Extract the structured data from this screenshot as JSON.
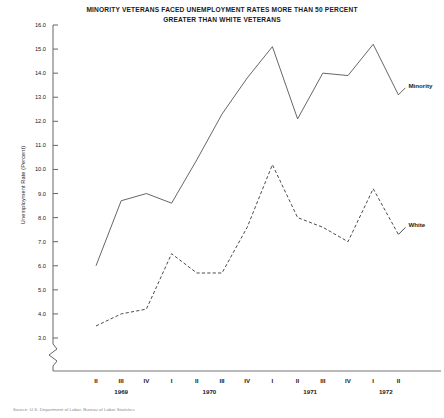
{
  "chart_data": {
    "type": "line",
    "title": "MINORITY VETERANS FACED UNEMPLOYMENT RATES MORE THAN 50 PERCENT GREATER THAN WHITE VETERANS",
    "title_line1": "MINORITY VETERANS FACED UNEMPLOYMENT RATES MORE THAN 50 PERCENT",
    "title_line2": "GREATER THAN WHITE VETERANS",
    "xlabel": "",
    "ylabel": "Unemployment Rate (Percent)",
    "ylim": [
      3.0,
      16.0
    ],
    "grid": false,
    "legend_position": "right-inline",
    "axis_break": true,
    "categories": [
      "II",
      "III",
      "IV",
      "I",
      "II",
      "III",
      "IV",
      "I",
      "II",
      "III",
      "IV",
      "I",
      "II"
    ],
    "years": [
      {
        "label": "1969",
        "start_index": 0,
        "end_index": 2
      },
      {
        "label": "1970",
        "start_index": 3,
        "end_index": 6
      },
      {
        "label": "1971",
        "start_index": 7,
        "end_index": 10
      },
      {
        "label": "1972",
        "start_index": 11,
        "end_index": 12
      }
    ],
    "ytick_labels": [
      "16.0",
      "15.0",
      "14.0",
      "13.0",
      "12.0",
      "11.0",
      "10.0",
      "9.0",
      "8.0",
      "7.0",
      "6.0",
      "5.0",
      "4.0",
      "3.0"
    ],
    "ytick_values": [
      16.0,
      15.0,
      14.0,
      13.0,
      12.0,
      11.0,
      10.0,
      9.0,
      8.0,
      7.0,
      6.0,
      5.0,
      4.0,
      3.0
    ],
    "series": [
      {
        "name": "Minority",
        "style": "solid",
        "color": "#4a4a4a",
        "values": [
          6.0,
          8.7,
          9.0,
          8.6,
          10.4,
          12.3,
          13.8,
          15.1,
          12.1,
          14.0,
          13.9,
          15.2,
          13.1
        ]
      },
      {
        "name": "White",
        "style": "dashed",
        "color": "#2a2a2a",
        "values": [
          3.5,
          4.0,
          4.2,
          6.5,
          5.7,
          5.7,
          7.6,
          10.2,
          8.0,
          7.6,
          7.0,
          9.2,
          7.3
        ]
      }
    ]
  },
  "source": {
    "note": "Source: U.S. Department of Labor, Bureau of Labor Statistics"
  }
}
